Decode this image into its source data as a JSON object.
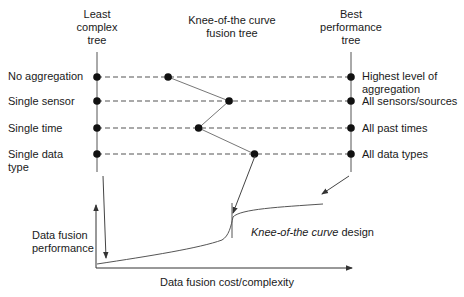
{
  "headers": {
    "left": [
      "Least",
      "complex",
      "tree"
    ],
    "middle": [
      "Knee-of-the curve",
      "fusion tree"
    ],
    "right": [
      "Best",
      "performance",
      "tree"
    ]
  },
  "rows": [
    {
      "left": [
        "No aggregation"
      ],
      "right": [
        "Highest level of",
        "aggregation"
      ],
      "knee_position": 0.28
    },
    {
      "left": [
        "Single sensor"
      ],
      "right": [
        "All sensors/sources"
      ],
      "knee_position": 0.52
    },
    {
      "left": [
        "Single time"
      ],
      "right": [
        "All past times"
      ],
      "knee_position": 0.4
    },
    {
      "left": [
        "Single data",
        "type"
      ],
      "right": [
        "All data types"
      ],
      "knee_position": 0.62
    }
  ],
  "graph": {
    "ylabel": [
      "Data fusion",
      "performance"
    ],
    "xlabel": "Data fusion cost/complexity",
    "annotation_italic": "Knee-of-the curve",
    "annotation_rest": " design"
  },
  "colors": {
    "line": "#555555",
    "dot": "#111111",
    "text": "#1a1a1a"
  }
}
